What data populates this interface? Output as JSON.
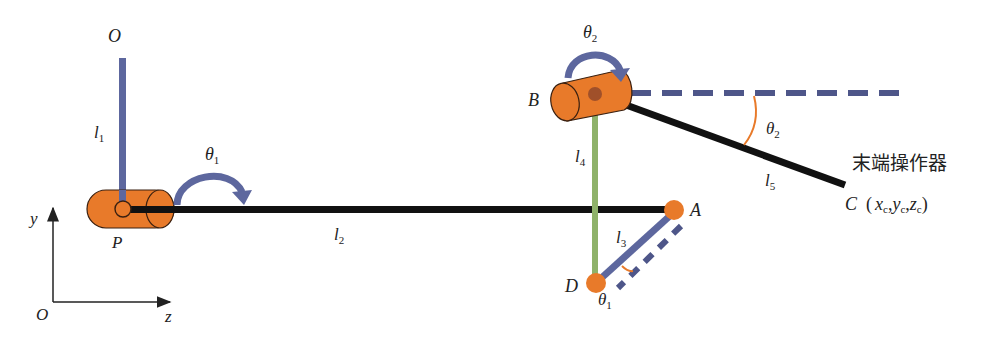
{
  "diagram": {
    "type": "robot-arm-kinematics",
    "colors": {
      "link_blue": "#5d679e",
      "link_black": "#111111",
      "link_green": "#8fb26a",
      "joint_orange": "#e87a2a",
      "angle_arc": "#e87a2a",
      "dashed_ref": "#4e5689"
    },
    "axes": {
      "origin_label": "O",
      "y_label": "y",
      "z_label": "z"
    },
    "points": {
      "O_top": "O",
      "P": "P",
      "A": "A",
      "B": "B",
      "C": "C",
      "D": "D"
    },
    "links": {
      "l1": {
        "base": "l",
        "sub": "1"
      },
      "l2": {
        "base": "l",
        "sub": "2"
      },
      "l3": {
        "base": "l",
        "sub": "3"
      },
      "l4": {
        "base": "l",
        "sub": "4"
      },
      "l5": {
        "base": "l",
        "sub": "5"
      }
    },
    "angles": {
      "theta1_joint": {
        "base": "θ",
        "sub": "1"
      },
      "theta1_D": {
        "base": "θ",
        "sub": "1"
      },
      "theta2_joint": {
        "base": "θ",
        "sub": "2"
      },
      "theta2_C": {
        "base": "θ",
        "sub": "2"
      }
    },
    "end_effector": {
      "label": "末端操作器",
      "coord_open": "(",
      "x": "x",
      "x_sub": "c",
      "y": "y",
      "y_sub": "c",
      "z": "z",
      "z_sub": "c",
      "sep": ",",
      "coord_close": ")"
    }
  }
}
